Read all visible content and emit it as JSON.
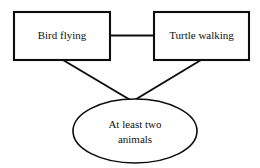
{
  "diagram": {
    "type": "relationship-diagram",
    "background_color": "#ffffff",
    "stroke_color": "#0d0d0d",
    "text_color": "#101010",
    "nodes": [
      {
        "id": "bird-flying",
        "shape": "rectangle",
        "label": "Bird flying",
        "x": 14,
        "y": 12,
        "width": 96,
        "height": 48
      },
      {
        "id": "turtle-walking",
        "shape": "rectangle",
        "label": "Turtle walking",
        "x": 154,
        "y": 12,
        "width": 95,
        "height": 48
      },
      {
        "id": "at-least-two-animals",
        "shape": "ellipse",
        "label_line_1": "At least two",
        "label_line_2": "animals",
        "cx": 135,
        "cy": 131,
        "rx": 62,
        "ry": 32
      }
    ],
    "edges": [
      {
        "id": "bird-to-turtle",
        "from": "bird-flying",
        "to": "turtle-walking",
        "style": "horizontal-line"
      },
      {
        "id": "bird-to-animals",
        "from": "bird-flying",
        "to": "at-least-two-animals",
        "style": "diagonal-line"
      },
      {
        "id": "turtle-to-animals",
        "from": "turtle-walking",
        "to": "at-least-two-animals",
        "style": "diagonal-line"
      }
    ]
  }
}
